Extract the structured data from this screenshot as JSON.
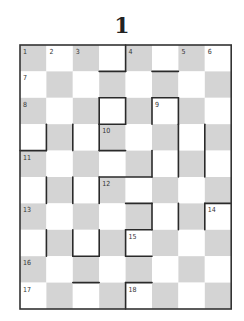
{
  "puzzle": {
    "title": "1",
    "cols": 8,
    "rows": 10,
    "origin": [
      20,
      45
    ],
    "cell_size": 26.4,
    "colors": {
      "shade": "#d4d4d4",
      "light": "#ffffff",
      "border": "#333333",
      "bar": "#2a2a2a"
    },
    "shading_rule": "gray where (row+col) even",
    "clue_numbers": [
      {
        "n": "1",
        "row": 0,
        "col": 0
      },
      {
        "n": "2",
        "row": 0,
        "col": 1
      },
      {
        "n": "3",
        "row": 0,
        "col": 2
      },
      {
        "n": "4",
        "row": 0,
        "col": 4
      },
      {
        "n": "5",
        "row": 0,
        "col": 6
      },
      {
        "n": "6",
        "row": 0,
        "col": 7
      },
      {
        "n": "7",
        "row": 1,
        "col": 0
      },
      {
        "n": "8",
        "row": 2,
        "col": 0
      },
      {
        "n": "9",
        "row": 2,
        "col": 5
      },
      {
        "n": "10",
        "row": 3,
        "col": 3
      },
      {
        "n": "11",
        "row": 4,
        "col": 0
      },
      {
        "n": "12",
        "row": 5,
        "col": 3
      },
      {
        "n": "13",
        "row": 6,
        "col": 0
      },
      {
        "n": "14",
        "row": 6,
        "col": 7
      },
      {
        "n": "15",
        "row": 7,
        "col": 4
      },
      {
        "n": "16",
        "row": 8,
        "col": 0
      },
      {
        "n": "17",
        "row": 9,
        "col": 0
      },
      {
        "n": "18",
        "row": 9,
        "col": 4
      }
    ],
    "bars": [
      [
        4,
        0,
        4,
        1
      ],
      [
        3,
        1,
        4,
        1
      ],
      [
        5,
        1,
        6,
        1
      ],
      [
        3,
        2,
        4,
        2
      ],
      [
        4,
        2,
        4,
        3
      ],
      [
        3,
        2,
        3,
        3
      ],
      [
        3,
        3,
        4,
        3
      ],
      [
        5,
        2,
        6,
        2
      ],
      [
        5,
        2,
        5,
        3
      ],
      [
        6,
        2,
        6,
        3
      ],
      [
        1,
        3,
        1,
        4
      ],
      [
        0,
        4,
        1,
        4
      ],
      [
        2,
        3,
        2,
        4
      ],
      [
        3,
        3,
        3,
        4
      ],
      [
        3,
        4,
        4,
        4
      ],
      [
        6,
        3,
        6,
        5
      ],
      [
        7,
        3,
        7,
        5
      ],
      [
        3,
        5,
        5,
        5
      ],
      [
        5,
        4,
        5,
        5
      ],
      [
        1,
        5,
        1,
        6
      ],
      [
        2,
        5,
        2,
        6
      ],
      [
        3,
        5,
        3,
        6
      ],
      [
        4,
        6,
        5,
        6
      ],
      [
        5,
        6,
        5,
        7
      ],
      [
        6,
        6,
        6,
        7
      ],
      [
        7,
        6,
        8,
        6
      ],
      [
        7,
        6,
        7,
        7
      ],
      [
        1,
        7,
        1,
        8
      ],
      [
        2,
        7,
        2,
        8
      ],
      [
        3,
        7,
        3,
        8
      ],
      [
        2,
        8,
        3,
        8
      ],
      [
        4,
        7,
        5,
        7
      ],
      [
        4,
        7,
        4,
        8
      ],
      [
        4,
        8,
        5,
        8
      ],
      [
        2,
        9,
        3,
        9
      ],
      [
        4,
        9,
        5,
        9
      ],
      [
        4,
        9,
        4,
        10
      ]
    ]
  }
}
